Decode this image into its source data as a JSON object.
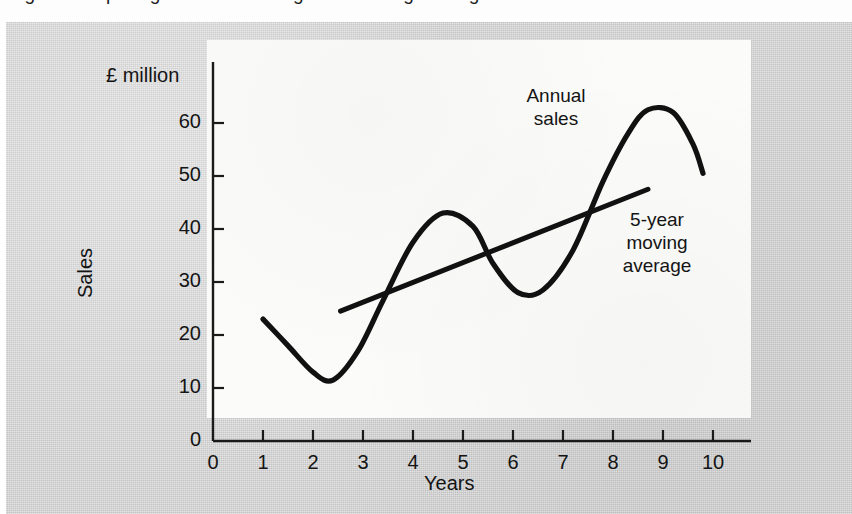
{
  "caption": {
    "clipped_line": "Figure  comparing annual sales against moving average"
  },
  "chart_data": {
    "type": "line",
    "title": "",
    "xlabel": "Years",
    "ylabel": "Sales",
    "unit_label": "£ million",
    "xlim": [
      0,
      10.4
    ],
    "ylim": [
      0,
      66
    ],
    "xticks": [
      "0",
      "1",
      "2",
      "3",
      "4",
      "5",
      "6",
      "7",
      "8",
      "9",
      "10"
    ],
    "xtick_values": [
      0,
      1,
      2,
      3,
      4,
      5,
      6,
      7,
      8,
      9,
      10
    ],
    "yticks": [
      "0",
      "10",
      "20",
      "30",
      "40",
      "50",
      "60"
    ],
    "ytick_values": [
      0,
      10,
      20,
      30,
      40,
      50,
      60
    ],
    "grid": false,
    "legend": "annotations",
    "series": [
      {
        "name": "Annual sales",
        "style": "smooth-curve",
        "color": "#111111",
        "x": [
          1.0,
          1.5,
          2.0,
          2.4,
          2.9,
          3.4,
          4.0,
          4.6,
          5.2,
          5.6,
          6.1,
          6.6,
          7.2,
          7.8,
          8.3,
          8.7,
          9.2,
          9.6,
          9.8
        ],
        "y": [
          23.0,
          18.0,
          13.0,
          11.5,
          17.0,
          26.5,
          37.5,
          43.0,
          40.5,
          33.5,
          28.0,
          28.5,
          36.0,
          49.0,
          58.0,
          62.5,
          62.0,
          56.0,
          50.5
        ]
      },
      {
        "name": "5-year moving average",
        "style": "straight-line",
        "color": "#111111",
        "x": [
          2.55,
          8.7
        ],
        "y": [
          24.5,
          47.5
        ]
      }
    ],
    "annotations": [
      {
        "id": "annual-sales",
        "text": "Annual\nsales",
        "x": 5.9,
        "y": 58
      },
      {
        "id": "moving-average",
        "text": "5-year\nmoving\naverage",
        "x": 7.9,
        "y": 38
      }
    ]
  }
}
